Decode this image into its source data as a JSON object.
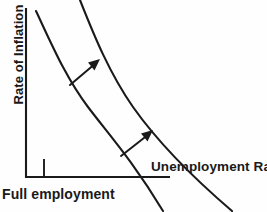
{
  "figure": {
    "background_color": "#fefefe",
    "line_color": "#1a1a1a",
    "text_color": "#1a1a1a"
  },
  "axes": {
    "y_label": "Rate of Inflation",
    "x_label": "Unemployment Rate",
    "tick_label": "Full employment",
    "origin": [
      26,
      178
    ],
    "y_top": 8,
    "x_right": 170,
    "tick_x": 44,
    "tick_top": 160,
    "tick_bottom": 178
  },
  "chart_data": {
    "type": "line",
    "xlabel": "Unemployment Rate",
    "ylabel": "Rate of Inflation",
    "grid": false,
    "legend": "none",
    "annotations": [
      {
        "name": "full-employment-tick",
        "text": "Full employment",
        "x": 44
      },
      {
        "name": "shift-arrow-upper",
        "from": [
          70,
          85
        ],
        "to": [
          99,
          61
        ]
      },
      {
        "name": "shift-arrow-lower",
        "from": [
          121,
          156
        ],
        "to": [
          152,
          132
        ]
      }
    ],
    "series": [
      {
        "name": "Original Phillips curve",
        "path": "M 36,11 C 52,45 66,78 88,107 C 110,136 132,160 163,211"
      },
      {
        "name": "Shifted Phillips curve",
        "path": "M 80,0 C 95,38 110,74 133,107 C 157,141 190,175 232,211"
      }
    ]
  }
}
